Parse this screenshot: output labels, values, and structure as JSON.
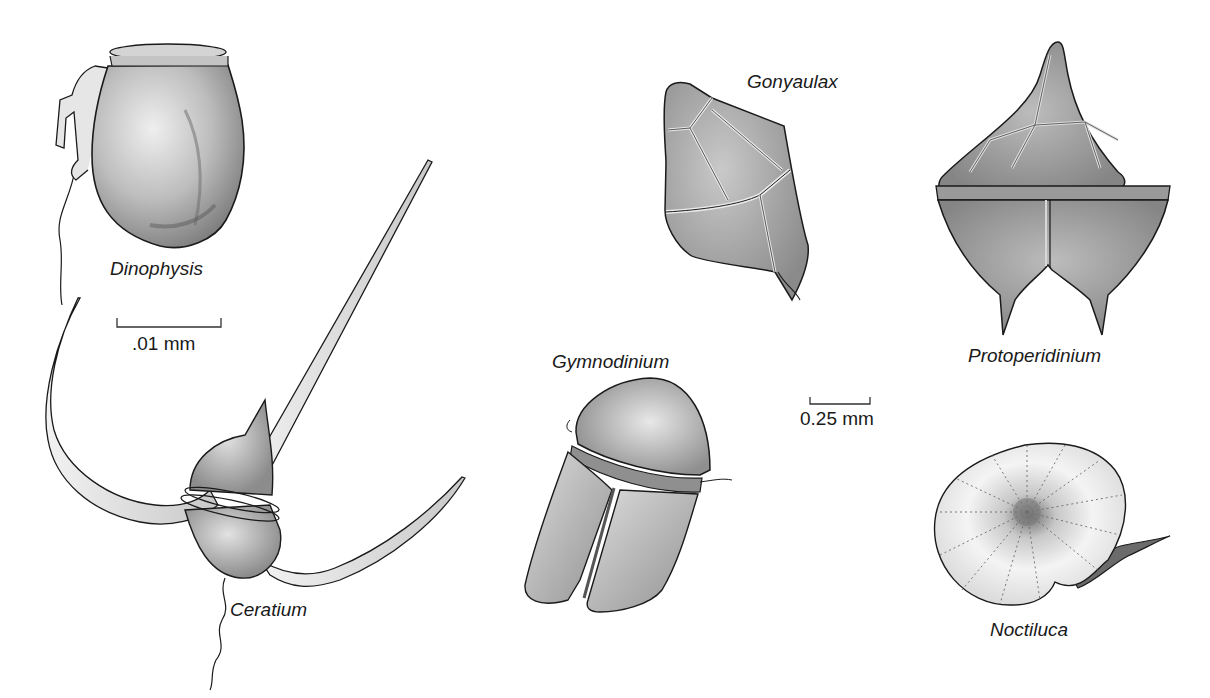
{
  "figure": {
    "background": "#ffffff",
    "ink_color": "#1a1a1a",
    "fill_light": "#d9d9d9",
    "fill_mid": "#b3b3b3",
    "fill_dark": "#8a8a8a"
  },
  "organisms": [
    {
      "id": "dinophysis",
      "label": "Dinophysis"
    },
    {
      "id": "ceratium",
      "label": "Ceratium"
    },
    {
      "id": "gonyaulax",
      "label": "Gonyaulax"
    },
    {
      "id": "gymnodinium",
      "label": "Gymnodinium"
    },
    {
      "id": "protoperidinium",
      "label": "Protoperidinium"
    },
    {
      "id": "noctiluca",
      "label": "Noctiluca"
    }
  ],
  "scale_bars": [
    {
      "id": "small",
      "label": ".01 mm"
    },
    {
      "id": "large",
      "label": "0.25 mm"
    }
  ]
}
